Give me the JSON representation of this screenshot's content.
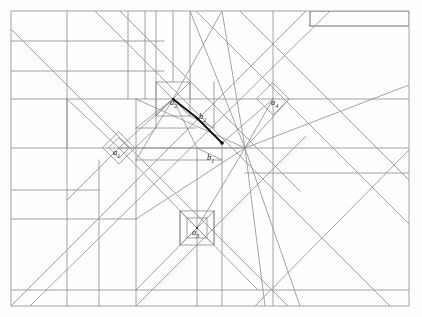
{
  "figure": {
    "type": "geometric-line-arrangement",
    "canvas": {
      "width": 422,
      "height": 317
    },
    "colors": {
      "background": "#fefefe",
      "line": "#8c8c8c",
      "line_dark": "#6e6e6e",
      "border": "#9a9a9a",
      "highlight": "#0d0d0d",
      "label": "#1a1a1a"
    },
    "frame": {
      "x": 11,
      "y": 11,
      "width": 398,
      "height": 295
    },
    "labels": [
      {
        "id": "a1",
        "base": "a",
        "sub": "1",
        "x": 113,
        "y": 152,
        "anchor": "point-a1"
      },
      {
        "id": "a2",
        "base": "a",
        "sub": "2",
        "x": 170,
        "y": 102,
        "anchor": "point-a2"
      },
      {
        "id": "a3",
        "base": "a",
        "sub": "3",
        "x": 192,
        "y": 232,
        "anchor": "point-a3"
      },
      {
        "id": "a4",
        "base": "a",
        "sub": "4",
        "x": 271,
        "y": 102,
        "anchor": "point-a4"
      },
      {
        "id": "b1",
        "base": "b",
        "sub": "1",
        "x": 207,
        "y": 158,
        "anchor": "point-b1"
      },
      {
        "id": "b2",
        "base": "b",
        "sub": "2",
        "x": 199,
        "y": 117,
        "anchor": "point-b2"
      }
    ],
    "points": [
      {
        "id": "a1",
        "x": 119,
        "y": 148
      },
      {
        "id": "a2",
        "x": 173,
        "y": 99
      },
      {
        "id": "a3",
        "x": 197,
        "y": 228
      },
      {
        "id": "a4",
        "x": 273,
        "y": 99
      },
      {
        "id": "b2",
        "x": 197,
        "y": 118
      },
      {
        "id": "b1",
        "x": 222,
        "y": 143
      },
      {
        "id": "hub",
        "x": 245,
        "y": 148
      }
    ],
    "highlight_path": {
      "name": "bold-polyline-a2-b2-b1",
      "vertices": "173,99 197,118 222,143",
      "width": 1.8,
      "endpoint_dot_radius": 1.8
    },
    "cells": {
      "a1_diamond": {
        "cx": 119,
        "cy": 148,
        "r": 16
      },
      "a4_diamond": {
        "cx": 273,
        "cy": 99,
        "r": 16
      },
      "a2_square": {
        "x": 156,
        "y": 82,
        "size": 34
      },
      "a3_square": {
        "x": 180,
        "y": 211,
        "size": 34
      }
    }
  }
}
